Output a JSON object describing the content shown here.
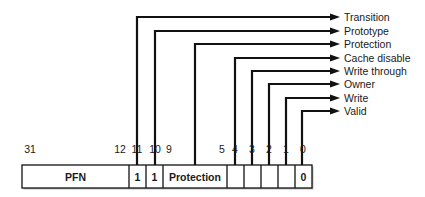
{
  "diagram": {
    "colors": {
      "line": "#111111",
      "text": "#1a1a1a",
      "background": "#ffffff"
    },
    "bit_labels": [
      {
        "text": "31",
        "x": 30
      },
      {
        "text": "12",
        "x": 120
      },
      {
        "text": "11",
        "x": 137
      },
      {
        "text": "10",
        "x": 155
      },
      {
        "text": "9",
        "x": 169
      },
      {
        "text": "5",
        "x": 222
      },
      {
        "text": "4",
        "x": 235
      },
      {
        "text": "3",
        "x": 252
      },
      {
        "text": "2",
        "x": 269
      },
      {
        "text": "1",
        "x": 286
      },
      {
        "text": "0",
        "x": 303
      }
    ],
    "cells": [
      {
        "name": "pfn",
        "text": "PFN",
        "x0": 22,
        "x1": 129
      },
      {
        "name": "bit-11",
        "text": "1",
        "x0": 129,
        "x1": 146
      },
      {
        "name": "bit-10",
        "text": "1",
        "x0": 146,
        "x1": 163
      },
      {
        "name": "protection",
        "text": "Protection",
        "x0": 163,
        "x1": 227
      },
      {
        "name": "bit-4",
        "text": "",
        "x0": 227,
        "x1": 244
      },
      {
        "name": "bit-3",
        "text": "",
        "x0": 244,
        "x1": 261
      },
      {
        "name": "bit-2",
        "text": "",
        "x0": 261,
        "x1": 278
      },
      {
        "name": "bit-1",
        "text": "",
        "x0": 278,
        "x1": 295
      },
      {
        "name": "bit-0",
        "text": "0",
        "x0": 295,
        "x1": 312
      }
    ],
    "fields": [
      {
        "label": "Transition",
        "x": 137,
        "y": 17
      },
      {
        "label": "Prototype",
        "x": 155,
        "y": 31
      },
      {
        "label": "Protection",
        "x": 195,
        "y": 44
      },
      {
        "label": "Cache disable",
        "x": 235,
        "y": 58
      },
      {
        "label": "Write through",
        "x": 252,
        "y": 71
      },
      {
        "label": "Owner",
        "x": 269,
        "y": 84
      },
      {
        "label": "Write",
        "x": 286,
        "y": 98
      },
      {
        "label": "Valid",
        "x": 302,
        "y": 111
      }
    ]
  }
}
